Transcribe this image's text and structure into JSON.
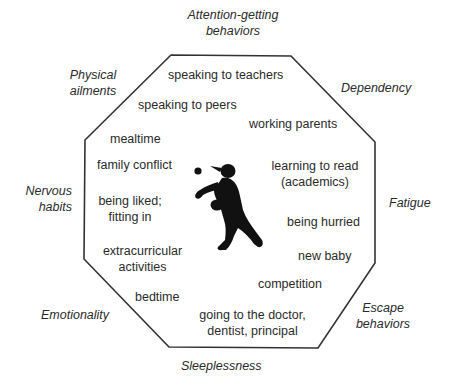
{
  "diagram": {
    "center_figure": "child-throwing-ball-silhouette",
    "outer_labels": {
      "top": "Attention-getting behaviors",
      "top_line1": "Attention-getting",
      "top_line2": "behaviors",
      "top_right": "Dependency",
      "right": "Fatigue",
      "bottom_right_line1": "Escape",
      "bottom_right_line2": "behaviors",
      "bottom": "Sleeplessness",
      "bottom_left": "Emotionality",
      "left_line1": "Nervous",
      "left_line2": "habits",
      "top_left_line1": "Physical",
      "top_left_line2": "ailments"
    },
    "inner_items": {
      "speaking_to_teachers": "speaking to teachers",
      "speaking_to_peers": "speaking to peers",
      "working_parents": "working parents",
      "mealtime": "mealtime",
      "family_conflict": "family conflict",
      "learning_to_read_line1": "learning to read",
      "learning_to_read_line2": "(academics)",
      "being_liked_line1": "being liked;",
      "being_liked_line2": "fitting in",
      "being_hurried": "being hurried",
      "extracurricular_line1": "extracurricular",
      "extracurricular_line2": "activities",
      "new_baby": "new baby",
      "competition": "competition",
      "bedtime": "bedtime",
      "doctor_line1": "going to the doctor,",
      "doctor_line2": "dentist, principal"
    },
    "colors": {
      "line": "#333333",
      "text": "#2b2b2b",
      "figure": "#111111"
    }
  }
}
